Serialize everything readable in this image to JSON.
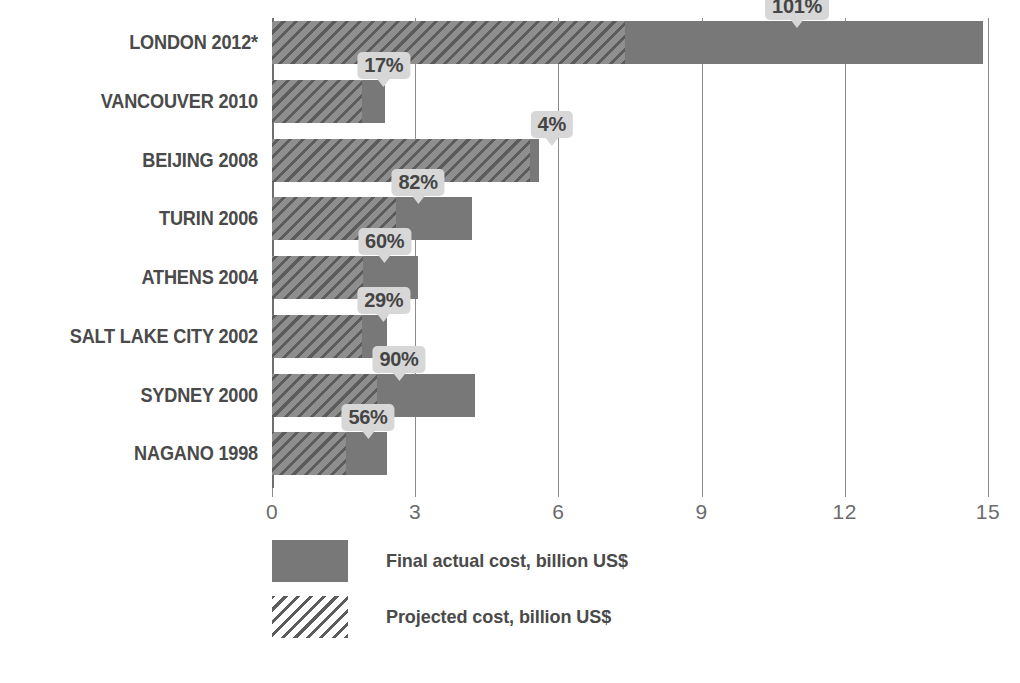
{
  "chart_data": {
    "type": "bar",
    "orientation": "horizontal",
    "title": "",
    "xlabel": "",
    "ylabel": "",
    "xlim": [
      0,
      15
    ],
    "xticks": [
      "0",
      "3",
      "6",
      "9",
      "12",
      "15"
    ],
    "grid": true,
    "legend_position": "bottom-left",
    "categories": [
      "LONDON 2012*",
      "VANCOUVER 2010",
      "BEIJING 2008",
      "TURIN 2006",
      "ATHENS 2004",
      "SALT LAKE CITY 2002",
      "SYDNEY 2000",
      "NAGANO 1998"
    ],
    "series": [
      {
        "name": "Final actual cost, billion US$",
        "style": "solid",
        "values": [
          14.9,
          2.37,
          5.6,
          4.2,
          3.05,
          2.4,
          4.25,
          2.4
        ]
      },
      {
        "name": "Projected cost, billion US$",
        "style": "hatched",
        "values": [
          7.4,
          1.88,
          5.4,
          2.6,
          1.9,
          1.88,
          2.2,
          1.55
        ]
      }
    ],
    "overrun_labels": [
      "101%",
      "17%",
      "4%",
      "82%",
      "60%",
      "29%",
      "90%",
      "56%"
    ],
    "overrun_values": [
      101,
      17,
      4,
      82,
      60,
      29,
      90,
      56
    ]
  },
  "legend": {
    "items": [
      {
        "swatch": "solid",
        "label": "Final actual cost, billion US$"
      },
      {
        "swatch": "hatch",
        "label": "Projected cost, billion US$"
      }
    ]
  },
  "colors": {
    "bar_solid": "#787878",
    "hatch_line": "#5c5c5c",
    "callout_bg": "#d7d7d7",
    "text": "#4a4a4a",
    "axis": "#8c8c8c"
  }
}
